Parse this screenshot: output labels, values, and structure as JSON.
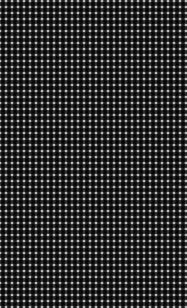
{
  "image": {
    "kind": "texture-swatch",
    "pattern_name": "gingham-plaid-weave",
    "width": 187,
    "height": 308,
    "background_color": "#ffffff",
    "caption": "Black and white gingham plaid woven texture swatch"
  },
  "palette": {
    "warp_dark": "#1c1c1c",
    "weft_dark": "#2b2b2b",
    "crossing_dark": "#111111",
    "mid_gray": "#8a8a8a",
    "light_gray": "#d6d6d6",
    "white": "#ffffff"
  },
  "pattern": {
    "vertical": {
      "period_px": 6,
      "stripe_width_px": 4,
      "gap_width_px": 2,
      "phase_px": 1,
      "blur_px": 0.6
    },
    "horizontal": {
      "period_px": 6,
      "stripe_width_px": 4,
      "gap_width_px": 2,
      "phase_px": 2,
      "blur_px": 0.5
    },
    "weave": {
      "warp_opacity": 0.92,
      "weft_opacity": 0.8,
      "noise_amount": 10,
      "edge_softness": 1.0
    }
  },
  "chart_data": {
    "type": "heatmap",
    "xlabel": "x (px)",
    "ylabel": "y (px)",
    "xlim": [
      0,
      187
    ],
    "ylim": [
      0,
      308
    ],
    "grid": false,
    "legend": "none",
    "colorscale": [
      "#ffffff",
      "#8a8a8a",
      "#111111"
    ],
    "vertical_profile": {
      "period_px": 6,
      "values": [
        30,
        25,
        25,
        30,
        240,
        245
      ]
    },
    "horizontal_profile": {
      "period_px": 6,
      "values": [
        45,
        40,
        40,
        45,
        238,
        243
      ]
    }
  }
}
